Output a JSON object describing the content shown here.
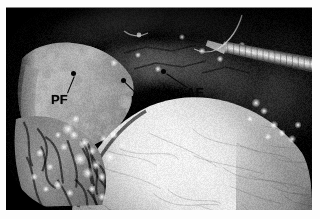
{
  "figure": {
    "kind": "endoscopic-photograph",
    "modality": "laparoscopic / endoscopic intraoperative still image",
    "color_mode": "grayscale",
    "frame": {
      "outer_background": "#fdfdfd",
      "plate_background": "#000000",
      "plate_left": 6,
      "plate_top": 7,
      "plate_width": 306,
      "plate_height": 203
    },
    "caption": "",
    "overlay_text_color": "#050505"
  },
  "annotations": [
    {
      "id": "pf",
      "label": "PF",
      "meaning": "PF",
      "label_x": 45,
      "label_y": 86,
      "dot_x": 67,
      "dot_y": 66,
      "line_from_x": 61,
      "line_from_y": 86,
      "line_to_x": 68,
      "line_to_y": 69
    },
    {
      "id": "e",
      "label": "E",
      "meaning": "E",
      "label_x": 125,
      "label_y": 87,
      "dot_x": 117,
      "dot_y": 73,
      "line_from_x": 130,
      "line_from_y": 87,
      "line_to_x": 119,
      "line_to_y": 76
    },
    {
      "id": "af",
      "label": "AF",
      "meaning": "AF",
      "label_x": 180,
      "label_y": 79,
      "dot_x": 157,
      "dot_y": 64,
      "line_from_x": 181,
      "line_from_y": 81,
      "line_to_x": 160,
      "line_to_y": 67
    }
  ],
  "scene": {
    "instruments": [
      {
        "name": "metal-instrument-shaft",
        "description": "bright metallic shaft entering from upper right"
      },
      {
        "name": "suture-thread",
        "description": "fine curved suture/needle thread near upper centre-right"
      }
    ],
    "structures": [
      {
        "name": "bright-dome",
        "description": "large pale dome-shaped tissue mass filling lower centre-right"
      },
      {
        "name": "left-flap",
        "description": "pale tissue flap on the left side"
      },
      {
        "name": "vignette",
        "description": "dark circular endoscope field-of-view vignette"
      }
    ]
  }
}
